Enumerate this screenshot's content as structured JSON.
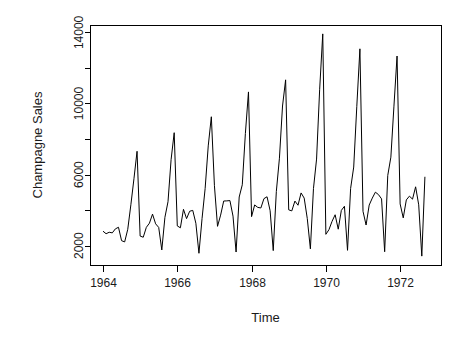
{
  "figure": {
    "width": 464,
    "height": 342,
    "background": "#ffffff",
    "foreground": "#000000"
  },
  "chart_data": {
    "type": "line",
    "title": "",
    "xlabel": "Time",
    "ylabel": "Champagne Sales",
    "xlim": [
      1964.0,
      1972.75
    ],
    "ylim": [
      1413,
      13916
    ],
    "grid": false,
    "legend": "none",
    "x_ticks_major": [
      1964,
      1966,
      1968,
      1970,
      1972
    ],
    "x_tick_labels": [
      "1964",
      "1966",
      "1968",
      "1970",
      "1972"
    ],
    "y_ticks_major": [
      2000,
      6000,
      10000,
      14000
    ],
    "y_tick_labels": [
      "2000",
      "6000",
      "10000",
      "14000"
    ],
    "y_ticks_minor": [
      4000,
      8000,
      12000
    ],
    "series": [
      {
        "name": "Champagne Sales",
        "color": "#000000",
        "x": [
          1964.0,
          1964.0833,
          1964.1667,
          1964.25,
          1964.3333,
          1964.4167,
          1964.5,
          1964.5833,
          1964.6667,
          1964.75,
          1964.8333,
          1964.9167,
          1965.0,
          1965.0833,
          1965.1667,
          1965.25,
          1965.3333,
          1965.4167,
          1965.5,
          1965.5833,
          1965.6667,
          1965.75,
          1965.8333,
          1965.9167,
          1966.0,
          1966.0833,
          1966.1667,
          1966.25,
          1966.3333,
          1966.4167,
          1966.5,
          1966.5833,
          1966.6667,
          1966.75,
          1966.8333,
          1966.9167,
          1967.0,
          1967.0833,
          1967.1667,
          1967.25,
          1967.3333,
          1967.4167,
          1967.5,
          1967.5833,
          1967.6667,
          1967.75,
          1967.8333,
          1967.9167,
          1968.0,
          1968.0833,
          1968.1667,
          1968.25,
          1968.3333,
          1968.4167,
          1968.5,
          1968.5833,
          1968.6667,
          1968.75,
          1968.8333,
          1968.9167,
          1969.0,
          1969.0833,
          1969.1667,
          1969.25,
          1969.3333,
          1969.4167,
          1969.5,
          1969.5833,
          1969.6667,
          1969.75,
          1969.8333,
          1969.9167,
          1970.0,
          1970.0833,
          1970.1667,
          1970.25,
          1970.3333,
          1970.4167,
          1970.5,
          1970.5833,
          1970.6667,
          1970.75,
          1970.8333,
          1970.9167,
          1971.0,
          1971.0833,
          1971.1667,
          1971.25,
          1971.3333,
          1971.4167,
          1971.5,
          1971.5833,
          1971.6667,
          1971.75,
          1971.8333,
          1971.9167,
          1972.0,
          1972.0833,
          1972.1667,
          1972.25,
          1972.3333,
          1972.4167,
          1972.5,
          1972.5833,
          1972.6667
        ],
        "values": [
          2815,
          2672,
          2755,
          2721,
          2946,
          3036,
          2282,
          2212,
          2922,
          4301,
          5764,
          7312,
          2541,
          2475,
          3031,
          3266,
          3776,
          3230,
          3028,
          1759,
          3595,
          4474,
          6838,
          8357,
          3113,
          3006,
          4047,
          3523,
          3937,
          3986,
          3260,
          1573,
          3528,
          5211,
          7614,
          9254,
          5375,
          3088,
          3718,
          4514,
          4520,
          4539,
          3663,
          1643,
          4739,
          5428,
          8314,
          10651,
          3633,
          4292,
          4154,
          4121,
          4647,
          4753,
          3965,
          1723,
          5048,
          6922,
          9858,
          11331,
          4016,
          3957,
          4510,
          4276,
          4968,
          4677,
          3523,
          1821,
          5222,
          6872,
          10803,
          13916,
          2639,
          2899,
          3370,
          3740,
          2927,
          3986,
          4217,
          1738,
          5221,
          6424,
          9842,
          13076,
          3934,
          3162,
          4286,
          4676,
          5010,
          4874,
          4633,
          1659,
          5951,
          6981,
          9851,
          12670,
          4348,
          3564,
          4577,
          4788,
          4618,
          5312,
          4298,
          1413,
          5877
        ]
      }
    ],
    "dataset_note": "Monthly champagne sales, Jan 1964 - Sep 1972"
  },
  "layout": {
    "plot_left": 90,
    "plot_right": 441,
    "plot_top": 25,
    "plot_bottom": 265,
    "tick_len": 6
  },
  "labels": {
    "y_axis_title": "Champagne Sales",
    "x_axis_title": "Time"
  }
}
